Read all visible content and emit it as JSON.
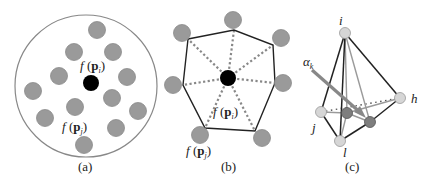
{
  "panels": [
    {
      "id": "a",
      "caption": "(a)",
      "label_center": {
        "f": "f",
        "open": " (",
        "p": "p",
        "sub": "i",
        "close": ")"
      },
      "label_neighbor": {
        "f": "f",
        "open": " (",
        "p": "p",
        "sub": "j",
        "close": ")"
      }
    },
    {
      "id": "b",
      "caption": "(b)",
      "label_center": {
        "f": "f",
        "open": " (",
        "p": "p",
        "sub": "i",
        "close": ")"
      },
      "label_neighbor": {
        "f": "f",
        "open": " (",
        "p": "p",
        "sub": "j",
        "close": ")"
      }
    },
    {
      "id": "c",
      "caption": "(c)",
      "vertex_labels": {
        "i": "i",
        "j": "j",
        "h": "h",
        "l": "l"
      },
      "alpha_label": {
        "symbol": "α",
        "sub": "k"
      }
    }
  ],
  "colors": {
    "gray_node": "#9a9a9a",
    "gray_node_stroke": "#8a8a8a",
    "center_node": "#000000",
    "light_node": "#d6d6d6",
    "dark_node": "#7e7e7e",
    "outline": "#222222",
    "gray_line": "#9a9a9a",
    "dotted": "#888888",
    "outer_circle": "#888888"
  }
}
